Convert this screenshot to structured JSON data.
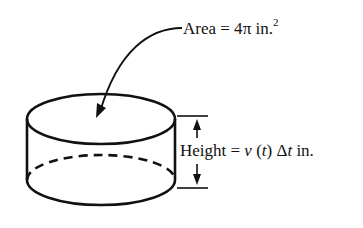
{
  "labels": {
    "area": {
      "prefix": "Area = 4",
      "pi": "π",
      "unit": " in.",
      "exponent": "2"
    },
    "height": {
      "prefix": "Height = ",
      "v": "v",
      "paren_open": " (",
      "t": "t",
      "paren_close": ") Δ",
      "t2": "t",
      "unit": " in."
    }
  },
  "colors": {
    "stroke": "#111111",
    "background": "#ffffff"
  }
}
